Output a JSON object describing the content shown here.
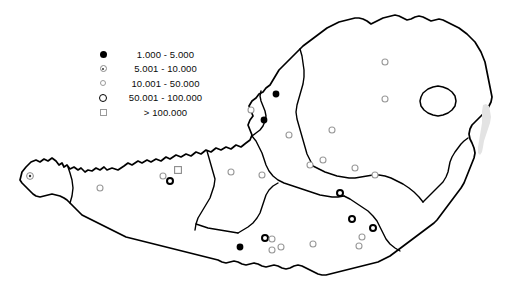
{
  "figure": {
    "type": "choropleth-point-map",
    "region": "Austria",
    "background_color": "#ffffff",
    "border_color": "#000000",
    "width": 519,
    "height": 285
  },
  "legend": {
    "position": "upper-left",
    "items": [
      {
        "symbol": "filled-circle",
        "label": "1.000 - 5.000",
        "min": 1000,
        "max": 5000
      },
      {
        "symbol": "dot-in-circle",
        "label": "5.001 - 10.000",
        "min": 5001,
        "max": 10000
      },
      {
        "symbol": "small-open-circle",
        "label": "10.001 - 50.000",
        "min": 10001,
        "max": 50000
      },
      {
        "symbol": "thick-ring-circle",
        "label": "50.001 - 100.000",
        "min": 50001,
        "max": 100000
      },
      {
        "symbol": "open-square",
        "label": "> 100.000",
        "min": 100001,
        "max": null
      }
    ]
  },
  "map_data": {
    "outline_color": "#000000",
    "outline_width": 1.6,
    "internal_border_width": 1.4,
    "lake_color": "#e3e3e3",
    "points": [
      {
        "id": "p01",
        "x": 30,
        "y": 176,
        "symbol": "dot-in-circle"
      },
      {
        "id": "p02",
        "x": 100,
        "y": 188,
        "symbol": "small-open-circle"
      },
      {
        "id": "p03",
        "x": 163,
        "y": 176,
        "symbol": "small-open-circle"
      },
      {
        "id": "p04",
        "x": 170,
        "y": 181,
        "symbol": "thick-ring-circle"
      },
      {
        "id": "p05",
        "x": 178,
        "y": 170,
        "symbol": "open-square"
      },
      {
        "id": "p06",
        "x": 231,
        "y": 172,
        "symbol": "small-open-circle"
      },
      {
        "id": "p07",
        "x": 240,
        "y": 247,
        "symbol": "filled-circle"
      },
      {
        "id": "p08",
        "x": 251,
        "y": 110,
        "symbol": "small-open-circle"
      },
      {
        "id": "p09",
        "x": 262,
        "y": 175,
        "symbol": "small-open-circle"
      },
      {
        "id": "p10",
        "x": 264,
        "y": 120,
        "symbol": "filled-circle"
      },
      {
        "id": "p11",
        "x": 265,
        "y": 238,
        "symbol": "thick-ring-circle"
      },
      {
        "id": "p12",
        "x": 272,
        "y": 239,
        "symbol": "small-open-circle"
      },
      {
        "id": "p13",
        "x": 272,
        "y": 250,
        "symbol": "small-open-circle"
      },
      {
        "id": "p14",
        "x": 276,
        "y": 94,
        "symbol": "filled-circle"
      },
      {
        "id": "p15",
        "x": 281,
        "y": 247,
        "symbol": "small-open-circle"
      },
      {
        "id": "p16",
        "x": 289,
        "y": 135,
        "symbol": "small-open-circle"
      },
      {
        "id": "p17",
        "x": 310,
        "y": 165,
        "symbol": "small-open-circle"
      },
      {
        "id": "p18",
        "x": 313,
        "y": 244,
        "symbol": "small-open-circle"
      },
      {
        "id": "p19",
        "x": 323,
        "y": 160,
        "symbol": "small-open-circle"
      },
      {
        "id": "p20",
        "x": 332,
        "y": 130,
        "symbol": "small-open-circle"
      },
      {
        "id": "p21",
        "x": 340,
        "y": 193,
        "symbol": "thick-ring-circle"
      },
      {
        "id": "p22",
        "x": 352,
        "y": 219,
        "symbol": "thick-ring-circle"
      },
      {
        "id": "p23",
        "x": 355,
        "y": 168,
        "symbol": "small-open-circle"
      },
      {
        "id": "p24",
        "x": 359,
        "y": 246,
        "symbol": "small-open-circle"
      },
      {
        "id": "p25",
        "x": 362,
        "y": 237,
        "symbol": "small-open-circle"
      },
      {
        "id": "p26",
        "x": 373,
        "y": 228,
        "symbol": "thick-ring-circle"
      },
      {
        "id": "p27",
        "x": 375,
        "y": 175,
        "symbol": "small-open-circle"
      },
      {
        "id": "p28",
        "x": 385,
        "y": 62,
        "symbol": "small-open-circle"
      },
      {
        "id": "p29",
        "x": 385,
        "y": 99,
        "symbol": "small-open-circle"
      }
    ]
  }
}
